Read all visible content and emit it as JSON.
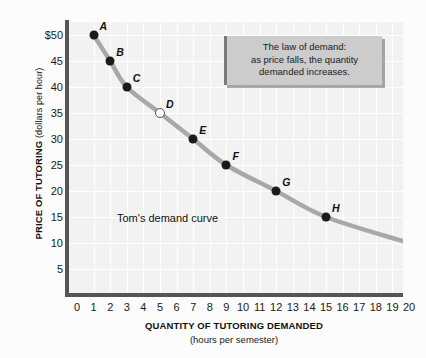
{
  "chart_data": {
    "type": "line",
    "title": "",
    "xlabel": "QUANTITY OF TUTORING DEMANDED",
    "xsublabel": "(hours per semester)",
    "ylabel": "PRICE OF TUTORING",
    "ysublabel": "(dollars per hour)",
    "xlim": [
      0,
      20
    ],
    "ylim": [
      0,
      52.5
    ],
    "grid": true,
    "legend": "none",
    "series_name": "Tom's demand curve",
    "x": [
      1,
      2,
      3,
      5,
      7,
      9,
      12,
      15,
      20
    ],
    "y": [
      50,
      45,
      40,
      35,
      30,
      25,
      20,
      15,
      10
    ],
    "point_labels": [
      "A",
      "B",
      "C",
      "D",
      "E",
      "F",
      "G",
      "H",
      "I"
    ],
    "point_styles": [
      "filled",
      "filled",
      "filled",
      "hollow",
      "filled",
      "filled",
      "filled",
      "filled",
      "filled"
    ],
    "xticks": [
      "0",
      "1",
      "2",
      "3",
      "4",
      "5",
      "6",
      "7",
      "8",
      "9",
      "10",
      "11",
      "12",
      "13",
      "14",
      "15",
      "16",
      "17",
      "18",
      "19",
      "20"
    ],
    "yticks": [
      "$50",
      "45",
      "40",
      "35",
      "30",
      "25",
      "20",
      "15",
      "10",
      "5"
    ],
    "ytick_values": [
      50,
      45,
      40,
      35,
      30,
      25,
      20,
      15,
      10,
      5
    ],
    "annotation": "The law of demand: as price falls, the quantity demanded increases.",
    "annotation_lines": [
      "The law of demand:",
      "as price falls, the quantity",
      "demanded increases."
    ],
    "curve_color": "#a8a8a8",
    "point_color": "#1a1a1a",
    "plot_background": "#f2f2f2",
    "gridline_color": "#ffffff",
    "axis_color": "#555555",
    "callout_background": "#cccccc"
  }
}
